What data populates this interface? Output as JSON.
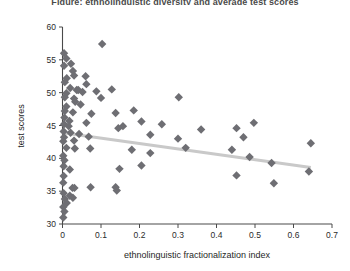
{
  "chart_data": {
    "type": "scatter",
    "title": "Figure: ethnolinguistic diversity and average test scores",
    "xlabel": "ethnolinguistic fractionalization index",
    "ylabel": "test scores",
    "xlim": [
      0,
      0.7
    ],
    "ylim": [
      30,
      60
    ],
    "xticks": [
      "0",
      "0.1",
      "0.2",
      "0.3",
      "0.4",
      "0.5",
      "0.6",
      "0.7"
    ],
    "xtick_values": [
      0,
      0.1,
      0.2,
      0.3,
      0.4,
      0.5,
      0.6,
      0.7
    ],
    "yticks": [
      "30",
      "35",
      "40",
      "45",
      "50",
      "55",
      "60"
    ],
    "ytick_values": [
      30,
      35,
      40,
      45,
      50,
      55,
      60
    ],
    "grid": false,
    "legend": null,
    "marker": {
      "shape": "diamond",
      "color": "#6e6e73",
      "size": 4.2
    },
    "trendline": {
      "type": "linear-fit",
      "color": "#c9c9c9",
      "width": 3.2,
      "x_start": 0.0,
      "y_start": 43.9,
      "x_end": 0.645,
      "y_end": 38.6
    },
    "points": [
      {
        "x": 0.004,
        "y": 56.0
      },
      {
        "x": 0.01,
        "y": 55.2
      },
      {
        "x": 0.004,
        "y": 54.1
      },
      {
        "x": 0.022,
        "y": 54.4
      },
      {
        "x": 0.027,
        "y": 53.3
      },
      {
        "x": 0.03,
        "y": 52.6
      },
      {
        "x": 0.011,
        "y": 52.2
      },
      {
        "x": 0.006,
        "y": 51.6
      },
      {
        "x": 0.06,
        "y": 52.5
      },
      {
        "x": 0.062,
        "y": 51.3
      },
      {
        "x": 0.103,
        "y": 57.4
      },
      {
        "x": 0.02,
        "y": 50.7
      },
      {
        "x": 0.037,
        "y": 50.4
      },
      {
        "x": 0.041,
        "y": 50.4
      },
      {
        "x": 0.052,
        "y": 50.1
      },
      {
        "x": 0.01,
        "y": 49.9
      },
      {
        "x": 0.006,
        "y": 49.3
      },
      {
        "x": 0.03,
        "y": 49.1
      },
      {
        "x": 0.033,
        "y": 48.6
      },
      {
        "x": 0.088,
        "y": 50.2
      },
      {
        "x": 0.128,
        "y": 50.5
      },
      {
        "x": 0.1,
        "y": 49.2
      },
      {
        "x": 0.01,
        "y": 47.9
      },
      {
        "x": 0.047,
        "y": 48.2
      },
      {
        "x": 0.006,
        "y": 47.2
      },
      {
        "x": 0.027,
        "y": 47.0
      },
      {
        "x": 0.075,
        "y": 46.8
      },
      {
        "x": 0.138,
        "y": 46.9
      },
      {
        "x": 0.185,
        "y": 47.3
      },
      {
        "x": 0.302,
        "y": 49.3
      },
      {
        "x": 0.005,
        "y": 46.2
      },
      {
        "x": 0.018,
        "y": 45.7
      },
      {
        "x": 0.004,
        "y": 45.2
      },
      {
        "x": 0.016,
        "y": 44.9
      },
      {
        "x": 0.062,
        "y": 45.4
      },
      {
        "x": 0.205,
        "y": 45.6
      },
      {
        "x": 0.258,
        "y": 45.2
      },
      {
        "x": 0.003,
        "y": 44.1
      },
      {
        "x": 0.021,
        "y": 43.9
      },
      {
        "x": 0.043,
        "y": 43.7
      },
      {
        "x": 0.004,
        "y": 43.2
      },
      {
        "x": 0.002,
        "y": 42.6
      },
      {
        "x": 0.03,
        "y": 42.7
      },
      {
        "x": 0.068,
        "y": 43.3
      },
      {
        "x": 0.145,
        "y": 44.6
      },
      {
        "x": 0.157,
        "y": 44.9
      },
      {
        "x": 0.228,
        "y": 43.6
      },
      {
        "x": 0.3,
        "y": 43.0
      },
      {
        "x": 0.36,
        "y": 44.4
      },
      {
        "x": 0.452,
        "y": 44.6
      },
      {
        "x": 0.47,
        "y": 43.2
      },
      {
        "x": 0.497,
        "y": 45.4
      },
      {
        "x": 0.645,
        "y": 42.3
      },
      {
        "x": 0.01,
        "y": 41.6
      },
      {
        "x": 0.032,
        "y": 41.5
      },
      {
        "x": 0.072,
        "y": 41.5
      },
      {
        "x": 0.18,
        "y": 41.3
      },
      {
        "x": 0.228,
        "y": 40.8
      },
      {
        "x": 0.32,
        "y": 41.6
      },
      {
        "x": 0.44,
        "y": 41.3
      },
      {
        "x": 0.486,
        "y": 40.2
      },
      {
        "x": 0.002,
        "y": 40.4
      },
      {
        "x": 0.005,
        "y": 39.7
      },
      {
        "x": 0.003,
        "y": 38.8
      },
      {
        "x": 0.019,
        "y": 38.3
      },
      {
        "x": 0.003,
        "y": 37.3
      },
      {
        "x": 0.148,
        "y": 38.4
      },
      {
        "x": 0.543,
        "y": 39.3
      },
      {
        "x": 0.64,
        "y": 38.0
      },
      {
        "x": 0.002,
        "y": 36.3
      },
      {
        "x": 0.026,
        "y": 35.5
      },
      {
        "x": 0.031,
        "y": 35.5
      },
      {
        "x": 0.073,
        "y": 35.6
      },
      {
        "x": 0.138,
        "y": 35.6
      },
      {
        "x": 0.141,
        "y": 35.1
      },
      {
        "x": 0.003,
        "y": 34.7
      },
      {
        "x": 0.019,
        "y": 34.3
      },
      {
        "x": 0.027,
        "y": 34.0
      },
      {
        "x": 0.006,
        "y": 33.8
      },
      {
        "x": 0.011,
        "y": 33.2
      },
      {
        "x": 0.002,
        "y": 32.6
      },
      {
        "x": 0.005,
        "y": 31.9
      },
      {
        "x": 0.002,
        "y": 31.0
      },
      {
        "x": 0.452,
        "y": 37.4
      },
      {
        "x": 0.549,
        "y": 36.2
      },
      {
        "x": 0.205,
        "y": 38.9
      }
    ]
  },
  "colors": {
    "background": "#ffffff",
    "axis": "#4a4a4a",
    "marker": "#6e6e73",
    "trendline": "#c9c9c9",
    "text": "#1f1f1f"
  }
}
